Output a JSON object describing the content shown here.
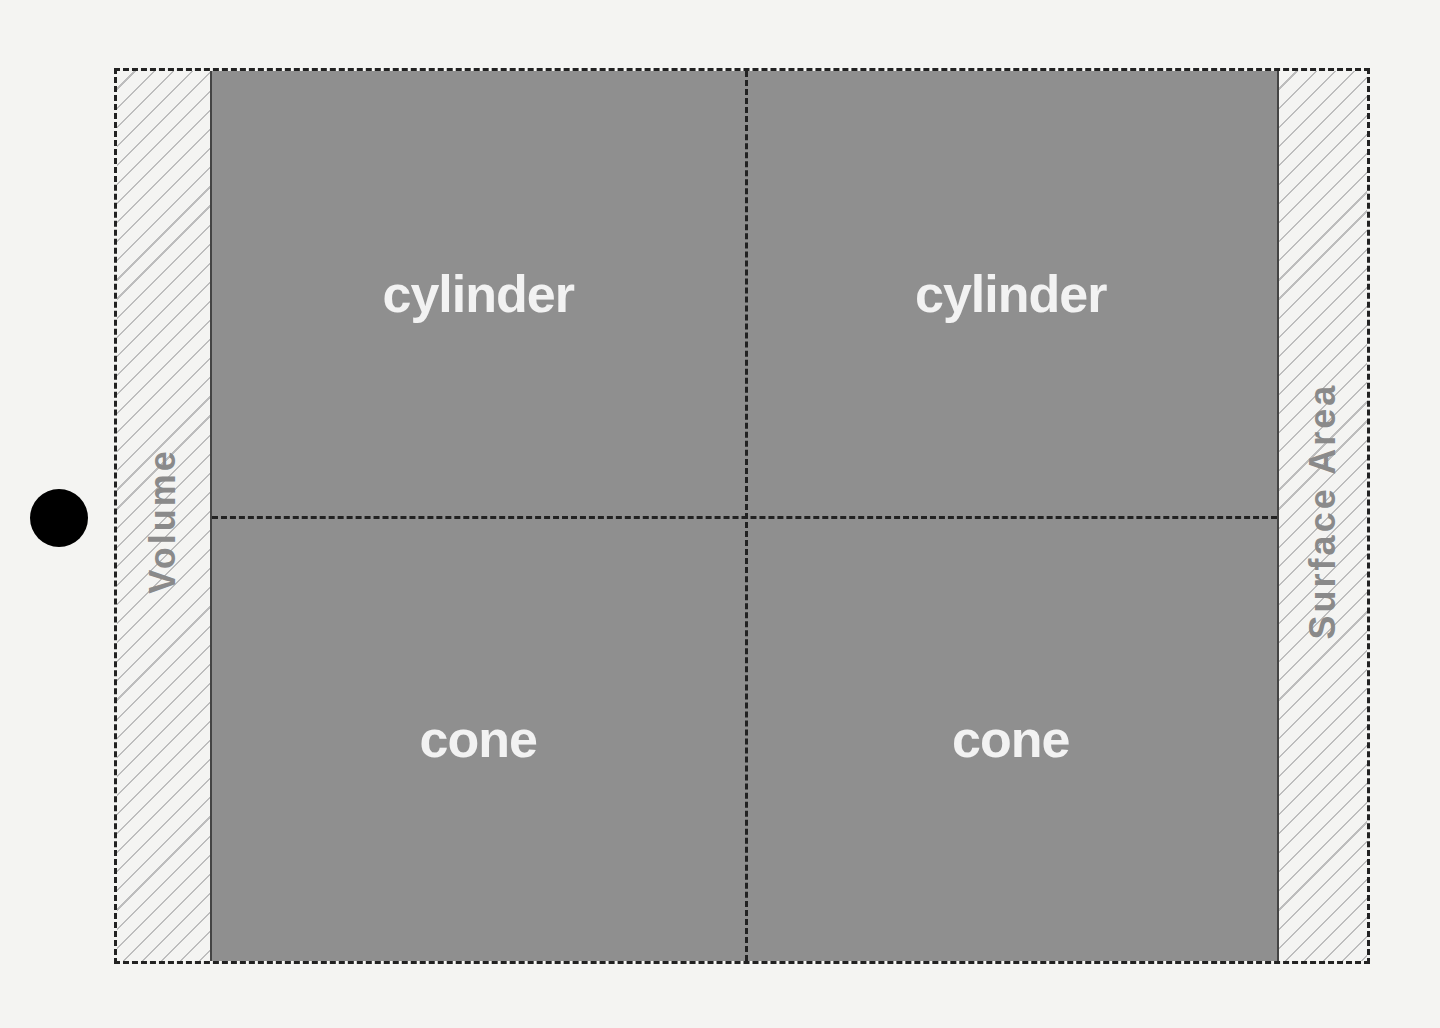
{
  "diagram": {
    "left_axis_label": "Volume",
    "right_axis_label": "Surface Area",
    "cells": [
      {
        "row": 1,
        "col": 1,
        "label": "cylinder"
      },
      {
        "row": 1,
        "col": 2,
        "label": "cylinder"
      },
      {
        "row": 2,
        "col": 1,
        "label": "cone"
      },
      {
        "row": 2,
        "col": 2,
        "label": "cone"
      }
    ],
    "colors": {
      "cell_fill": "#8f8f8f",
      "cell_text": "#f2f2f2",
      "label_text": "#8a8a8a",
      "marker": "#000000"
    }
  }
}
